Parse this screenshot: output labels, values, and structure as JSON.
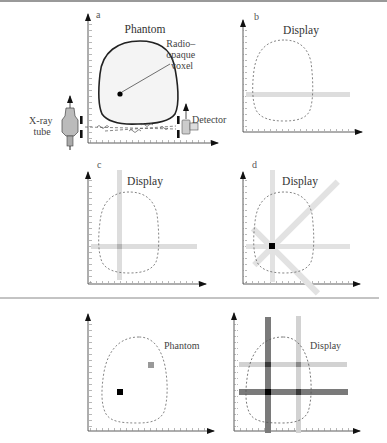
{
  "figure": {
    "top_rule_color": "#777777",
    "separator_color": "#888888",
    "panels": {
      "a": {
        "letter": "a",
        "title": "Phantom",
        "voxel_label_lines": [
          "Radio–",
          "opaque",
          "voxel"
        ],
        "source_label_lines": [
          "X-ray",
          "tube"
        ],
        "detector_label": "Detector"
      },
      "b": {
        "letter": "b",
        "title": "Display"
      },
      "c": {
        "letter": "c",
        "title": "Display"
      },
      "d": {
        "letter": "d",
        "title": "Display"
      },
      "e": {
        "title": "Phantom"
      },
      "f": {
        "title": "Display"
      }
    },
    "colors": {
      "phantom_fill": "#f4f4f4",
      "outline": "#222222",
      "dashed_outline": "#666666",
      "light_band": "#dddddd",
      "dark_band": "#777777",
      "mid_band": "#cccccc",
      "voxel_dark": "#000000",
      "voxel_gray": "#999999"
    }
  }
}
